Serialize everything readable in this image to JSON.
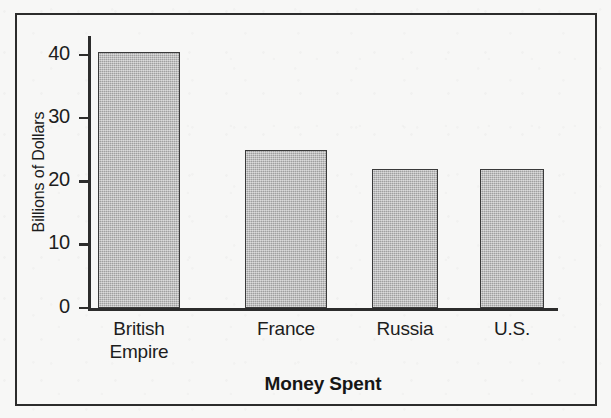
{
  "chart_data": {
    "type": "bar",
    "title": "",
    "xlabel": "Money Spent",
    "ylabel": "Billions of Dollars",
    "categories": [
      "British Empire",
      "France",
      "Russia",
      "U.S."
    ],
    "category_label_lines": [
      [
        "British",
        "Empire"
      ],
      [
        "France"
      ],
      [
        "Russia"
      ],
      [
        "U.S."
      ]
    ],
    "values": [
      40.5,
      25,
      22,
      22
    ],
    "ylim": [
      0,
      43
    ],
    "yticks": [
      0,
      10,
      20,
      30,
      40
    ],
    "ytick_labels": [
      "0",
      "10",
      "20",
      "30",
      "40"
    ],
    "grid": false,
    "legend": null,
    "bar_color": "#b0b0b0",
    "bar_edge_color": "#3a3a3a",
    "axis_color": "#2c2c2c",
    "background_color": "#f7f7f6"
  }
}
